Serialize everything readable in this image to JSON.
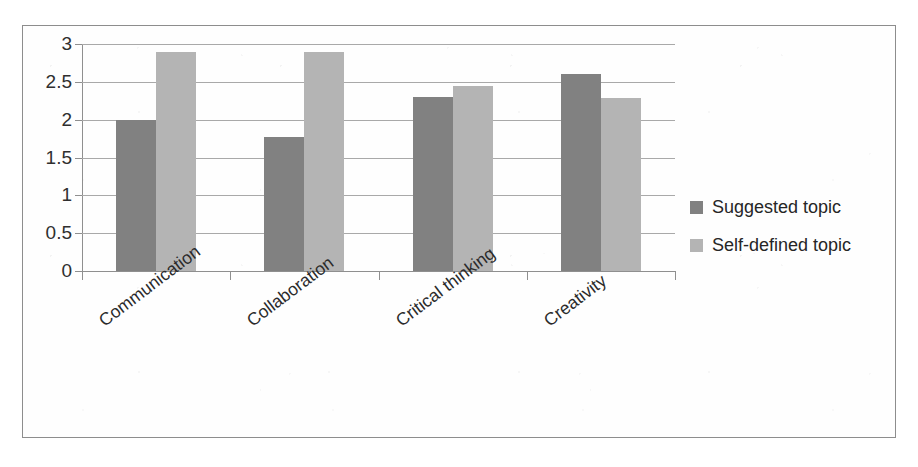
{
  "chart_data": {
    "type": "bar",
    "title": "",
    "subtitle": "",
    "xlabel": "",
    "ylabel": "",
    "categories": [
      "Communication",
      "Collaboration",
      "Critical thinking",
      "Creativity"
    ],
    "series": [
      {
        "name": "Suggested topic",
        "color": "#818181",
        "values": [
          2.0,
          1.77,
          2.3,
          2.6
        ]
      },
      {
        "name": "Self-defined topic",
        "color": "#b4b4b4",
        "values": [
          2.89,
          2.89,
          2.45,
          2.28
        ]
      }
    ],
    "ylim": [
      0,
      3
    ],
    "yticks": [
      "0",
      "0.5",
      "1",
      "1.5",
      "2",
      "2.5",
      "3"
    ],
    "ytick_values": [
      0,
      0.5,
      1,
      1.5,
      2,
      2.5,
      3
    ],
    "grid": true,
    "grid_axis": "y",
    "legend_position": "right",
    "category_label_rotation": -37,
    "frame": true
  },
  "colors": {
    "series_suggested": "#818181",
    "series_self_defined": "#b4b4b4",
    "gridline": "#a9a9a9",
    "axis": "#8f8f8f",
    "frame": "#8d8d8d",
    "text": "#2b2b2b",
    "background": "#ffffff"
  }
}
